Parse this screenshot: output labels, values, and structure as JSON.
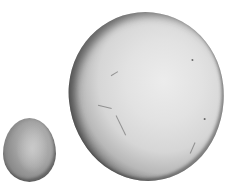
{
  "scene": {
    "description": "Two pale grey eggs/spheres on white background: a small oval egg at lower left and a large round egg to the right",
    "background_color": "#ffffff",
    "objects": [
      {
        "name": "small-egg",
        "shape": "oval",
        "color": "#a4a4a4"
      },
      {
        "name": "large-egg",
        "shape": "sphere",
        "color": "#e2e2e2"
      }
    ]
  }
}
